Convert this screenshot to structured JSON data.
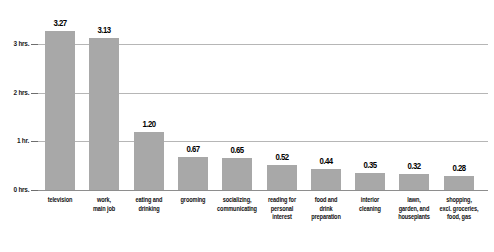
{
  "chart_data": {
    "type": "bar",
    "title": "",
    "subtitle": "",
    "xlabel": "",
    "ylabel": "",
    "ylim": [
      0,
      3.5
    ],
    "grid": true,
    "legend": null,
    "bar_color": "#a8a8a8",
    "gridline_color": "#b6b6b6",
    "axis_color": "#8e8e8e",
    "value_label_color": "#000000",
    "y_ticks": [
      {
        "value": 0,
        "label": "0 hrs."
      },
      {
        "value": 1,
        "label": "1 hr."
      },
      {
        "value": 2,
        "label": "2 hrs."
      },
      {
        "value": 3,
        "label": "3 hrs."
      }
    ],
    "categories": [
      "television",
      "work, main job",
      "eating and drinking",
      "grooming",
      "socializing, communicating",
      "reading for personal interest",
      "food and drink preparation",
      "interior cleaning",
      "lawn, garden, and houseplants",
      "shopping, excl. groceries, food, gas"
    ],
    "values": [
      3.27,
      3.13,
      1.2,
      0.67,
      0.65,
      0.52,
      0.44,
      0.35,
      0.32,
      0.28
    ],
    "value_labels": [
      "3.27",
      "3.13",
      "1.20",
      "0.67",
      "0.65",
      "0.52",
      "0.44",
      "0.35",
      "0.32",
      "0.28"
    ],
    "category_lines": [
      [
        "television"
      ],
      [
        "work,",
        "main job"
      ],
      [
        "eating and",
        "drinking"
      ],
      [
        "grooming"
      ],
      [
        "socializing,",
        "communicating"
      ],
      [
        "reading for",
        "personal",
        "interest"
      ],
      [
        "food and",
        "drink",
        "preparation"
      ],
      [
        "interior",
        "cleaning"
      ],
      [
        "lawn,",
        "garden, and",
        "houseplants"
      ],
      [
        "shopping,",
        "excl. groceries,",
        "food, gas"
      ]
    ]
  }
}
